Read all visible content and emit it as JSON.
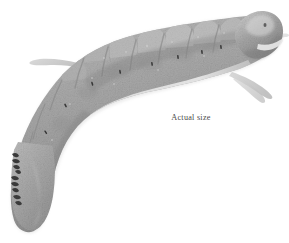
{
  "figure": {
    "orientation": "head-upper-right, tail-lower-left, body curved in a C shape",
    "rendering": "grayscale halftone photographic plate",
    "background_color": "#ffffff",
    "caption": {
      "text": "Actual size",
      "style": "serif",
      "color": "#4a4a4a"
    },
    "palette": {
      "background": "#ffffff",
      "body_light": "#c9c9c9",
      "body_mid": "#a8a8a8",
      "body_dark": "#8c8c8c",
      "body_shadow": "#6f6f6f",
      "lateral_stripe": "#dcdcdc",
      "head_highlight": "#d8d8d8",
      "spiracle": "#3a3a3a",
      "proleg_claw": "#2b2b2b",
      "leg_filament": "#cfcfcf",
      "outline": "#7a7a7a"
    },
    "anatomy": {
      "segments_visible": 8,
      "dorsal_edge": "scalloped with bumpy tubercles over the thoracic and abdominal segments",
      "spiracle_marks": 7,
      "proleg_clusters": 3,
      "leg_filaments": 3
    }
  }
}
